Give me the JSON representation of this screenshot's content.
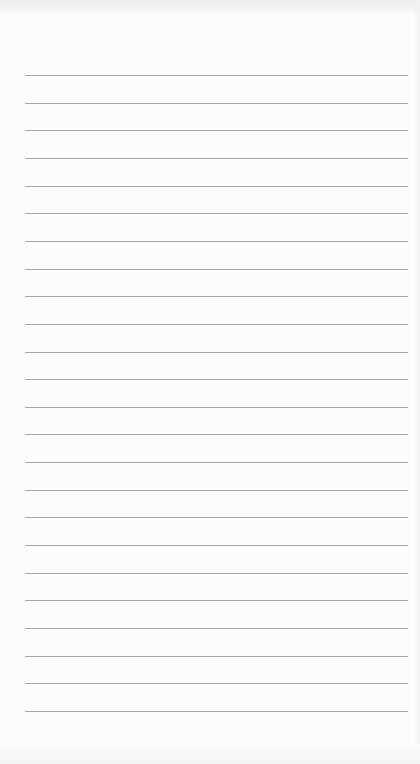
{
  "notepad": {
    "line_count": 24,
    "first_line_y": 75,
    "line_spacing": 27.65,
    "line_color": "#a6a6a6",
    "paper_color": "#fcfcfc",
    "lines": []
  }
}
